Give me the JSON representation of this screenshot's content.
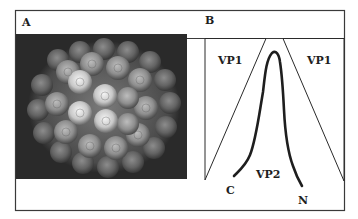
{
  "figure": {
    "panel_a": {
      "label": "A",
      "description": "Surface-rendered virus capsid composed of pentameric capsomeres on dark background"
    },
    "panel_b": {
      "label": "B",
      "labels": {
        "vp1_left": "VP1",
        "vp1_right": "VP1",
        "vp2": "VP2",
        "c_terminus": "C",
        "n_terminus": "N"
      }
    }
  },
  "colors": {
    "frame": "#3a3a3a",
    "panel_bg": "#2a2a2a",
    "line": "#1e1e1e",
    "background": "#ffffff"
  }
}
